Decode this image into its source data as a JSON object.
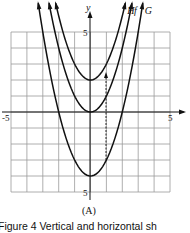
{
  "chart_data": {
    "type": "line",
    "title": "",
    "xlabel": "",
    "ylabel": "y",
    "xlim": [
      -5,
      5
    ],
    "ylim": [
      -5,
      5
    ],
    "grid": true,
    "x_ticks": [
      {
        "value": -5,
        "label": "-5"
      },
      {
        "value": 5,
        "label": "5"
      }
    ],
    "y_ticks": [
      {
        "value": 5,
        "label": "5"
      },
      {
        "value": -5,
        "label": "5"
      }
    ],
    "series": [
      {
        "name": "H",
        "formula": "x^2 + 2",
        "vertex": [
          0,
          2
        ]
      },
      {
        "name": "f",
        "formula": "x^2",
        "vertex": [
          0,
          0
        ]
      },
      {
        "name": "G",
        "formula": "x^2 - 4",
        "vertex": [
          0,
          -4
        ]
      }
    ],
    "annotations": [
      {
        "type": "arrow",
        "from": [
          1,
          -3
        ],
        "to": [
          1,
          2
        ],
        "style": "dashed",
        "direction": "up"
      }
    ],
    "panel_label": "(A)",
    "caption": "Figure 4   Vertical and horizontal sh"
  }
}
